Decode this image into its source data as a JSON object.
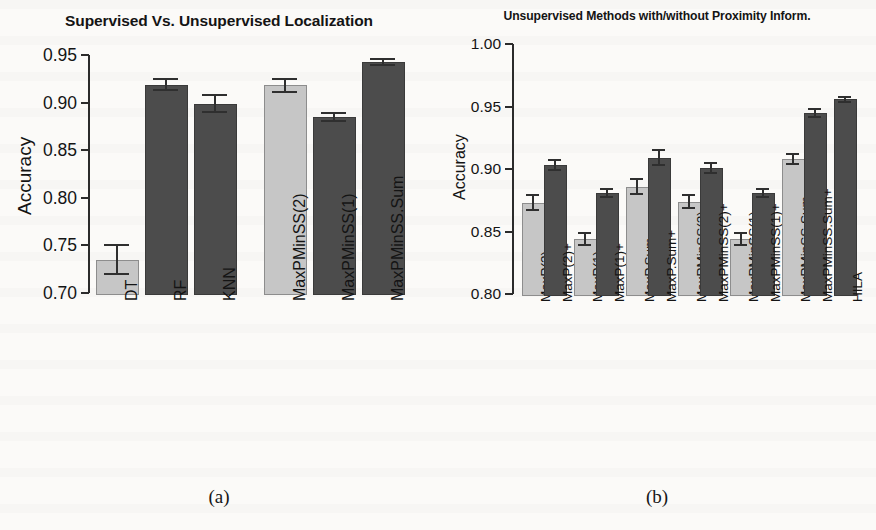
{
  "figure": {
    "caption_a": "(a)",
    "caption_b": "(b)"
  },
  "chart_data": [
    {
      "type": "bar",
      "panel": "a",
      "title": "Supervised Vs. Unsupervised Localization",
      "xlabel": "",
      "ylabel": "Accuracy",
      "ylim": [
        0.7,
        0.95
      ],
      "yticks": [
        "0.70",
        "0.75",
        "0.80",
        "0.85",
        "0.90",
        "0.95"
      ],
      "ytick_values": [
        0.7,
        0.75,
        0.8,
        0.85,
        0.9,
        0.95
      ],
      "grid": false,
      "legend": "none",
      "categories": [
        "DT",
        "RF",
        "KNN",
        "MaxPMinSS(2)",
        "MaxPMinSS(1)",
        "MaxPMinSS.Sum"
      ],
      "values": [
        0.735,
        0.919,
        0.899,
        0.918,
        0.885,
        0.943
      ],
      "errors": [
        0.015,
        0.006,
        0.009,
        0.007,
        0.004,
        0.003
      ],
      "shades": [
        "light",
        "dark",
        "dark",
        "light",
        "dark",
        "dark"
      ],
      "groups": [
        0,
        0,
        0,
        1,
        1,
        1
      ]
    },
    {
      "type": "bar",
      "panel": "b",
      "title": "Unsupervised Methods with/without Proximity Inform.",
      "xlabel": "",
      "ylabel": "Accuracy",
      "ylim": [
        0.8,
        1.0
      ],
      "yticks": [
        "0.80",
        "0.85",
        "0.90",
        "0.95",
        "1.00"
      ],
      "ytick_values": [
        0.8,
        0.85,
        0.9,
        0.95,
        1.0
      ],
      "grid": false,
      "legend": "none",
      "categories": [
        "MaxP(2)",
        "MaxP(2)+",
        "MaxP(1)",
        "MaxP(1)+",
        "MaxP.Sum",
        "MaxP.Sum+",
        "MaxPMinSS(2)",
        "MaxPMinSS(2)+",
        "MaxPMinSS(1)",
        "MaxPMinSS(1)+",
        "MaxPMinSS.Sum",
        "MaxPMinSS.Sum+",
        "HILA"
      ],
      "values": [
        0.873,
        0.903,
        0.844,
        0.881,
        0.886,
        0.909,
        0.874,
        0.901,
        0.844,
        0.881,
        0.908,
        0.945,
        0.956
      ],
      "errors": [
        0.006,
        0.004,
        0.005,
        0.003,
        0.006,
        0.006,
        0.005,
        0.004,
        0.005,
        0.003,
        0.004,
        0.003,
        0.002
      ],
      "shades": [
        "light",
        "dark",
        "light",
        "dark",
        "light",
        "dark",
        "light",
        "dark",
        "light",
        "dark",
        "light",
        "dark",
        "dark"
      ],
      "groups": [
        0,
        0,
        1,
        1,
        2,
        2,
        3,
        3,
        4,
        4,
        5,
        5,
        6
      ]
    }
  ]
}
